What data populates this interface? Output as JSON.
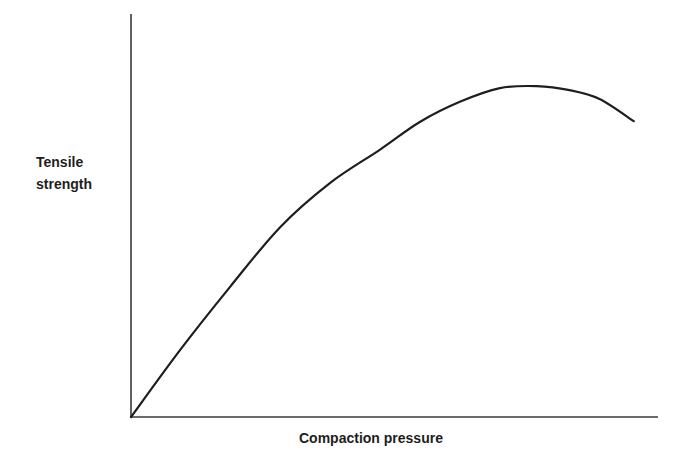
{
  "chart_data": {
    "type": "line",
    "title": "",
    "xlabel": "Compaction pressure",
    "ylabel_lines": [
      "Tensile",
      "strength"
    ],
    "xlim": [
      0,
      1
    ],
    "ylim": [
      0,
      1
    ],
    "grid": false,
    "legend": "none",
    "x_ticks": [],
    "y_ticks": [],
    "series": [
      {
        "name": "Tensile strength vs compaction pressure",
        "color": "#1e1e1e",
        "x": [
          0,
          0.093,
          0.188,
          0.283,
          0.378,
          0.472,
          0.548,
          0.624,
          0.7,
          0.77,
          0.832,
          0.889,
          0.954
        ],
        "y": [
          0,
          0.166,
          0.323,
          0.471,
          0.581,
          0.663,
          0.732,
          0.782,
          0.816,
          0.821,
          0.811,
          0.789,
          0.734
        ]
      }
    ]
  }
}
